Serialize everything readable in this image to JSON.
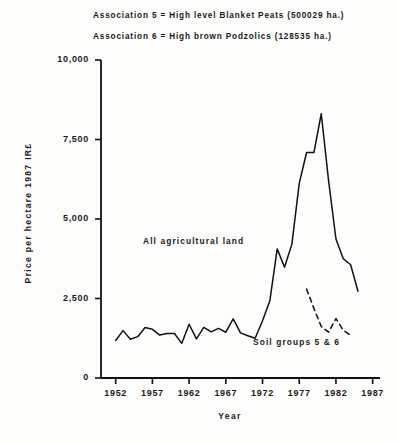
{
  "annotations": {
    "association_5": "Association 5 = High level Blanket Peats (500029 ha.)",
    "association_6": "Association 6 = High brown Podzolics (128535 ha.)"
  },
  "chart_data": {
    "type": "line",
    "title": "",
    "xlabel": "Year",
    "ylabel": "Price per hectare 1987 IR£",
    "xlim": [
      1950,
      1988
    ],
    "ylim": [
      0,
      10000
    ],
    "grid": false,
    "legend_position": "inline-annotations",
    "xticks": [
      1952,
      1957,
      1962,
      1967,
      1972,
      1977,
      1982,
      1987
    ],
    "xtick_labels": [
      "1952",
      "1957",
      "1962",
      "1967",
      "1972",
      "1977",
      "1982",
      "1987"
    ],
    "yticks": [
      0,
      2500,
      5000,
      7500,
      10000
    ],
    "ytick_labels": [
      "0",
      "2,500",
      "5,000",
      "7,500",
      "10,000"
    ],
    "series": [
      {
        "name": "All agricultural land",
        "style": "solid",
        "label": "All agricultural land",
        "x": [
          1952,
          1953,
          1954,
          1955,
          1956,
          1957,
          1958,
          1959,
          1960,
          1961,
          1962,
          1963,
          1964,
          1965,
          1966,
          1967,
          1968,
          1969,
          1970,
          1971,
          1972,
          1973,
          1974,
          1975,
          1976,
          1977,
          1978,
          1979,
          1980,
          1981,
          1982,
          1983,
          1984,
          1985
        ],
        "y": [
          1180,
          1490,
          1220,
          1300,
          1590,
          1530,
          1350,
          1400,
          1400,
          1090,
          1690,
          1230,
          1590,
          1450,
          1560,
          1440,
          1860,
          1420,
          1330,
          1250,
          1800,
          2430,
          4060,
          3480,
          4210,
          6120,
          7090,
          7090,
          8310,
          6200,
          4370,
          3750,
          3560,
          2730
        ]
      },
      {
        "name": "Soil groups 5 & 6",
        "style": "dashed",
        "label": "Soil groups 5 & 6",
        "x": [
          1978,
          1979,
          1980,
          1981,
          1982,
          1983,
          1984
        ],
        "y": [
          2800,
          2190,
          1620,
          1440,
          1870,
          1500,
          1340
        ]
      }
    ]
  }
}
